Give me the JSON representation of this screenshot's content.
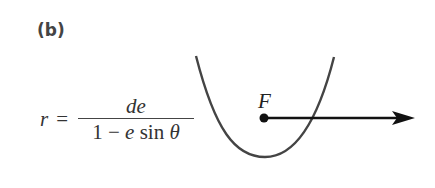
{
  "figure": {
    "label": "(b)",
    "formula": {
      "lhs": "r",
      "equals": "=",
      "numerator": "de",
      "denominator_prefix": "1 − ",
      "denominator_e": "e",
      "denominator_mid": " sin ",
      "denominator_theta": "θ"
    },
    "focus_label": "F",
    "curve": "parabola opening upward",
    "axis": "horizontal ray from focus to the right",
    "colors": {
      "curve": "#444444",
      "ink": "#111111",
      "text": "#333333"
    }
  }
}
